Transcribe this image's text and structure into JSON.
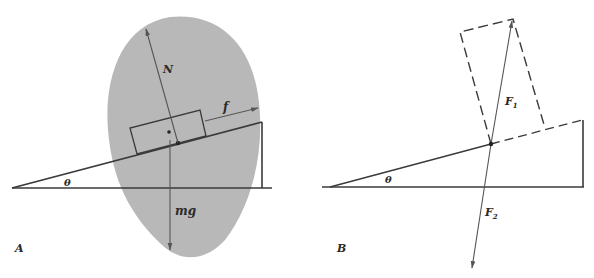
{
  "figure": {
    "panels": [
      {
        "id": "A",
        "label": "A",
        "angle_label": "θ",
        "vectors": [
          {
            "name": "normal-force",
            "label": "N"
          },
          {
            "name": "friction-force",
            "label": "f"
          },
          {
            "name": "weight",
            "label": "mg"
          }
        ],
        "region_color": "#b8b8b8"
      },
      {
        "id": "B",
        "label": "B",
        "angle_label": "θ",
        "vectors": [
          {
            "name": "resultant-force-up",
            "label": "F",
            "subscript": "1"
          },
          {
            "name": "resultant-force-down",
            "label": "F",
            "subscript": "2"
          }
        ]
      }
    ],
    "colors": {
      "ink": "#3a3a3a",
      "shaded_region": "#b8b8b8",
      "background": "#ffffff"
    }
  }
}
